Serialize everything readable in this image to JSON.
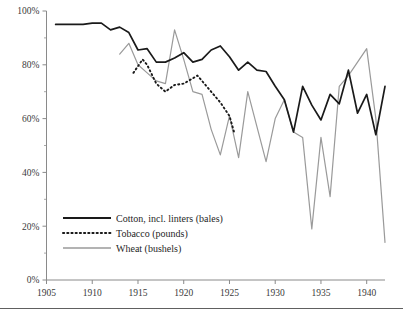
{
  "chart_data": {
    "type": "line",
    "title": "",
    "subtitle": "",
    "xlabel": "",
    "ylabel": "",
    "xlim": [
      1905,
      1942
    ],
    "ylim": [
      0,
      100
    ],
    "grid": false,
    "legend_position": "bottom-left",
    "y_tick_labels": [
      "0%",
      "20%",
      "40%",
      "60%",
      "80%",
      "100%"
    ],
    "y_tick_values": [
      0,
      20,
      40,
      60,
      80,
      100
    ],
    "y_minor_tick_values": [
      10,
      30,
      50,
      70,
      90
    ],
    "x_tick_labels": [
      "1905",
      "1910",
      "1915",
      "1920",
      "1925",
      "1930",
      "1935",
      "1940"
    ],
    "x_tick_values": [
      1905,
      1910,
      1915,
      1920,
      1925,
      1930,
      1935,
      1940
    ],
    "series": [
      {
        "name": "Cotton, incl. linters (bales)",
        "style": "solid",
        "color": "#1a1a1a",
        "x": [
          1906,
          1907,
          1908,
          1909,
          1910,
          1911,
          1912,
          1913,
          1914,
          1915,
          1916,
          1917,
          1918,
          1919,
          1920,
          1921,
          1922,
          1923,
          1924,
          1925,
          1926,
          1927,
          1928,
          1929,
          1930,
          1931,
          1932,
          1933,
          1934,
          1935,
          1936,
          1937,
          1938,
          1939,
          1940,
          1941,
          1942
        ],
        "y": [
          95,
          95,
          95,
          95,
          95.5,
          95.5,
          93,
          94,
          92,
          85.5,
          86,
          81,
          81,
          82.5,
          84.5,
          81,
          82,
          85.5,
          87,
          83,
          78,
          81,
          78,
          77.5,
          72,
          67,
          55,
          72,
          65,
          59.5,
          69,
          65.5,
          78,
          62,
          69,
          54,
          72
        ]
      },
      {
        "name": "Tobacco (pounds)",
        "style": "dotted",
        "color": "#1a1a1a",
        "x": [
          1914.5,
          1915.5,
          1916,
          1917,
          1918,
          1919,
          1920,
          1921.5,
          1922,
          1923,
          1924,
          1925,
          1925.5
        ],
        "y": [
          77,
          82,
          80,
          73,
          70,
          72.5,
          73,
          76,
          74,
          70,
          66,
          61,
          55
        ]
      },
      {
        "name": "Wheat (bushels)",
        "style": "solid",
        "color": "#9a9a9a",
        "x": [
          1913,
          1914,
          1915,
          1916,
          1917,
          1918,
          1919,
          1920,
          1921,
          1922,
          1923,
          1924,
          1925,
          1926,
          1927,
          1928,
          1929,
          1930,
          1931,
          1932,
          1933,
          1934,
          1935,
          1936,
          1937,
          1938,
          1939,
          1940,
          1941,
          1942
        ],
        "y": [
          84,
          88,
          80,
          77,
          74,
          73,
          93,
          82,
          70,
          69,
          56,
          46.5,
          61,
          45.5,
          70,
          57,
          44,
          60,
          67,
          55,
          53,
          19,
          53,
          31,
          72,
          76,
          81,
          86,
          60,
          14
        ]
      }
    ]
  },
  "axes": {
    "y_axis_name": "percent-axis",
    "x_axis_name": "year-axis"
  },
  "legend": {
    "items": [
      {
        "label": "Cotton, incl. linters (bales)",
        "style": "solid",
        "color": "#1a1a1a"
      },
      {
        "label": "Tobacco (pounds)",
        "style": "dotted",
        "color": "#1a1a1a"
      },
      {
        "label": "Wheat (bushels)",
        "style": "solid",
        "color": "#9a9a9a"
      }
    ]
  }
}
